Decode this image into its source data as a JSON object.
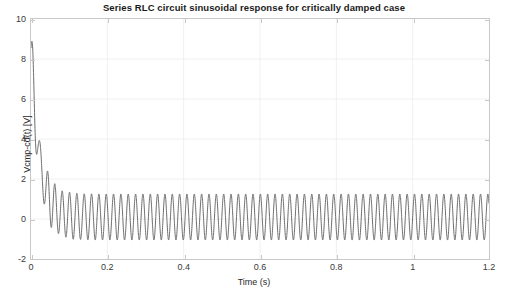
{
  "chart_data": {
    "type": "line",
    "title": "Series RLC circuit sinusoidal response for critically damped case",
    "xlabel": "Time (s)",
    "ylabel": "Vcmp-cd(t) [V]",
    "xlim": [
      0,
      1.2
    ],
    "ylim": [
      -2,
      10
    ],
    "xticks": [
      0,
      0.2,
      0.4,
      0.6,
      0.8,
      1,
      1.2
    ],
    "xtick_labels": [
      "0",
      "0.2",
      "0.4",
      "0.6",
      "0.8",
      "1",
      "1.2"
    ],
    "yticks": [
      -2,
      0,
      2,
      4,
      6,
      8,
      10
    ],
    "ytick_labels": [
      "-2",
      "0",
      "2",
      "4",
      "6",
      "8",
      "10"
    ],
    "grid": true,
    "legend": false,
    "line_color": "#6d6d6d",
    "line_width": 1.0,
    "grid_color": "#f0f0f0",
    "axes_color": "#c8c8c8",
    "background": "#ffffff",
    "series": [
      {
        "name": "Vcmp-cd(t)",
        "description": "Critically damped transient decaying from 8 V at t=0 superposed with a steady-state sinusoid of amplitude ~1.15 V about ~0.1 V offset at ~52 Hz",
        "model": {
          "initial_value": 8.0,
          "transient_decay_tau": 0.022,
          "transient_secondary_tau": 0.012,
          "steady_amplitude": 1.15,
          "steady_offset": 0.1,
          "frequency_hz": 52.0,
          "phase_rad": 0.0,
          "t_start": 0.0,
          "t_end": 1.2,
          "samples": 4000
        },
        "key_points": [
          {
            "t": 0.0,
            "v": 8.0
          },
          {
            "t": 0.012,
            "v": 4.6
          },
          {
            "t": 0.02,
            "v": 2.6
          },
          {
            "t": 0.027,
            "v": 3.0
          },
          {
            "t": 0.035,
            "v": 1.0
          },
          {
            "t": 0.045,
            "v": 1.8
          },
          {
            "t": 0.055,
            "v": -0.3
          },
          {
            "t": 0.07,
            "v": 1.3
          },
          {
            "t": 0.085,
            "v": -0.9
          },
          {
            "t": 0.12,
            "v": 1.25
          },
          {
            "t": 0.3,
            "v": 1.2
          },
          {
            "t": 0.6,
            "v": 1.2
          },
          {
            "t": 0.9,
            "v": 1.2
          },
          {
            "t": 1.2,
            "v": 1.2
          }
        ]
      }
    ]
  }
}
